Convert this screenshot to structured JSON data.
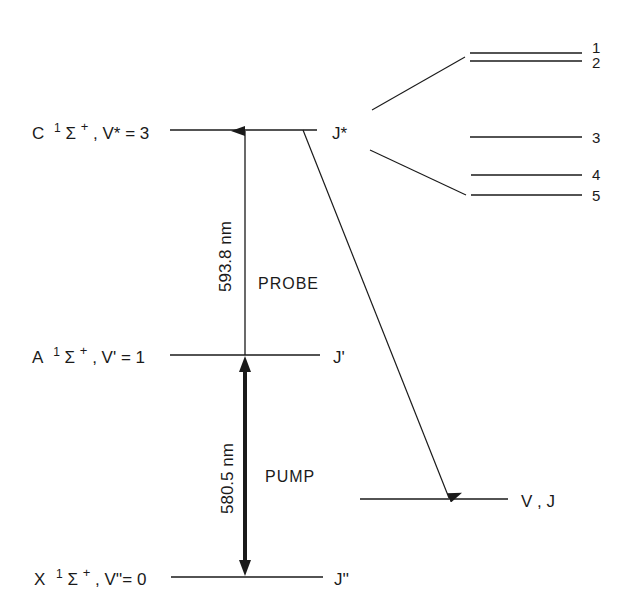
{
  "levels": {
    "c": {
      "state": "C",
      "term": "1",
      "sym": "Σ",
      "sup": "+",
      "vib": ", V* = 3",
      "rot": "J*"
    },
    "a": {
      "state": "A",
      "term": "1",
      "sym": "Σ",
      "sup": "+",
      "vib": ", V' = 1",
      "rot": "J'"
    },
    "x": {
      "state": "X",
      "term": "1",
      "sym": "Σ",
      "sup": "+",
      "vib": ", V''= 0",
      "rot": "J''"
    }
  },
  "transitions": {
    "probe": {
      "wavelength": "593.8 nm",
      "label": "PROBE"
    },
    "pump": {
      "wavelength": "580.5 nm",
      "label": "PUMP"
    }
  },
  "final_level": {
    "label": "V , J"
  },
  "sublevels": [
    "1",
    "2",
    "3",
    "4",
    "5"
  ],
  "colors": {
    "ink": "#1a1a1a",
    "background": "#ffffff"
  }
}
